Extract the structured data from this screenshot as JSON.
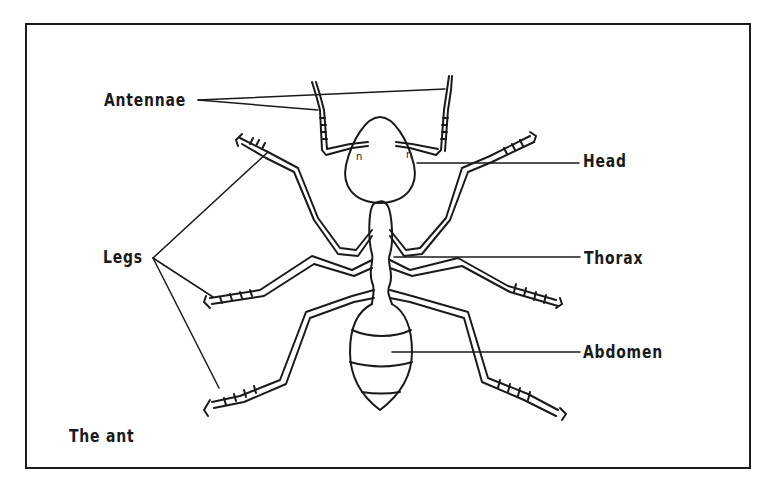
{
  "diagram": {
    "title": "The ant",
    "labels": {
      "antennae": "Antennae",
      "head": "Head",
      "legs": "Legs",
      "thorax": "Thorax",
      "abdomen": "Abdomen"
    },
    "caption": "The ant",
    "colors": {
      "ink": "#1a1a1a",
      "background": "#ffffff"
    }
  }
}
